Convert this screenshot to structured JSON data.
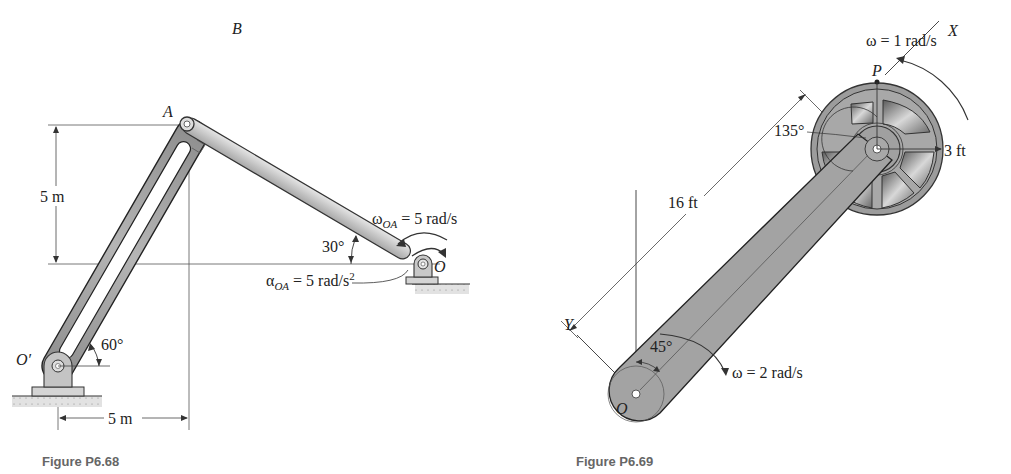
{
  "header_fragment": "",
  "figure_left": {
    "caption": "Figure P6.68",
    "labels": {
      "point_B": "B",
      "point_A": "A",
      "point_O": "O",
      "point_O_prime": "O′",
      "vertical_dim": "5 m",
      "horizontal_dim": "5 m",
      "angle_oa": "30°",
      "angle_base": "60°",
      "omega_prefix": "ω",
      "omega_sub": "OA",
      "omega_value": " = 5 rad/s",
      "alpha_prefix": "α",
      "alpha_sub": "OA",
      "alpha_value": " = 5 rad/s",
      "alpha_exp": "2"
    }
  },
  "figure_right": {
    "caption": "Figure P6.69",
    "labels": {
      "point_P": "P",
      "point_O": "O",
      "axis_X": "X",
      "axis_Y": "Y",
      "omega_disk": "ω = 1 rad/s",
      "omega_arm": "ω = 2 rad/s",
      "length": "16 ft",
      "radius": "3 ft",
      "angle_135": "135°",
      "angle_45": "45°"
    }
  },
  "colors": {
    "link_fill": "#9a9a9a",
    "link_light": "#d4d4d4",
    "stroke": "#333333",
    "ground": "#d9d9d9",
    "caption": "#666666"
  }
}
